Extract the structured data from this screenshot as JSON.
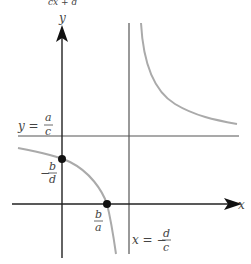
{
  "title_fragment": "cx + d",
  "axes": {
    "x_label": "x",
    "y_label": "y"
  },
  "asymptotes": {
    "horizontal": {
      "lhs": "y =",
      "num": "a",
      "den": "c"
    },
    "vertical": {
      "lhs": "x = −",
      "num": "d",
      "den": "c"
    }
  },
  "points": {
    "y_intercept": {
      "sign": "−",
      "num": "b",
      "den": "d"
    },
    "x_intercept": {
      "num": "b",
      "den": "a"
    }
  },
  "colors": {
    "axis": "#222222",
    "asymptote": "#555555",
    "curve": "#aaaaaa",
    "point": "#111111"
  }
}
